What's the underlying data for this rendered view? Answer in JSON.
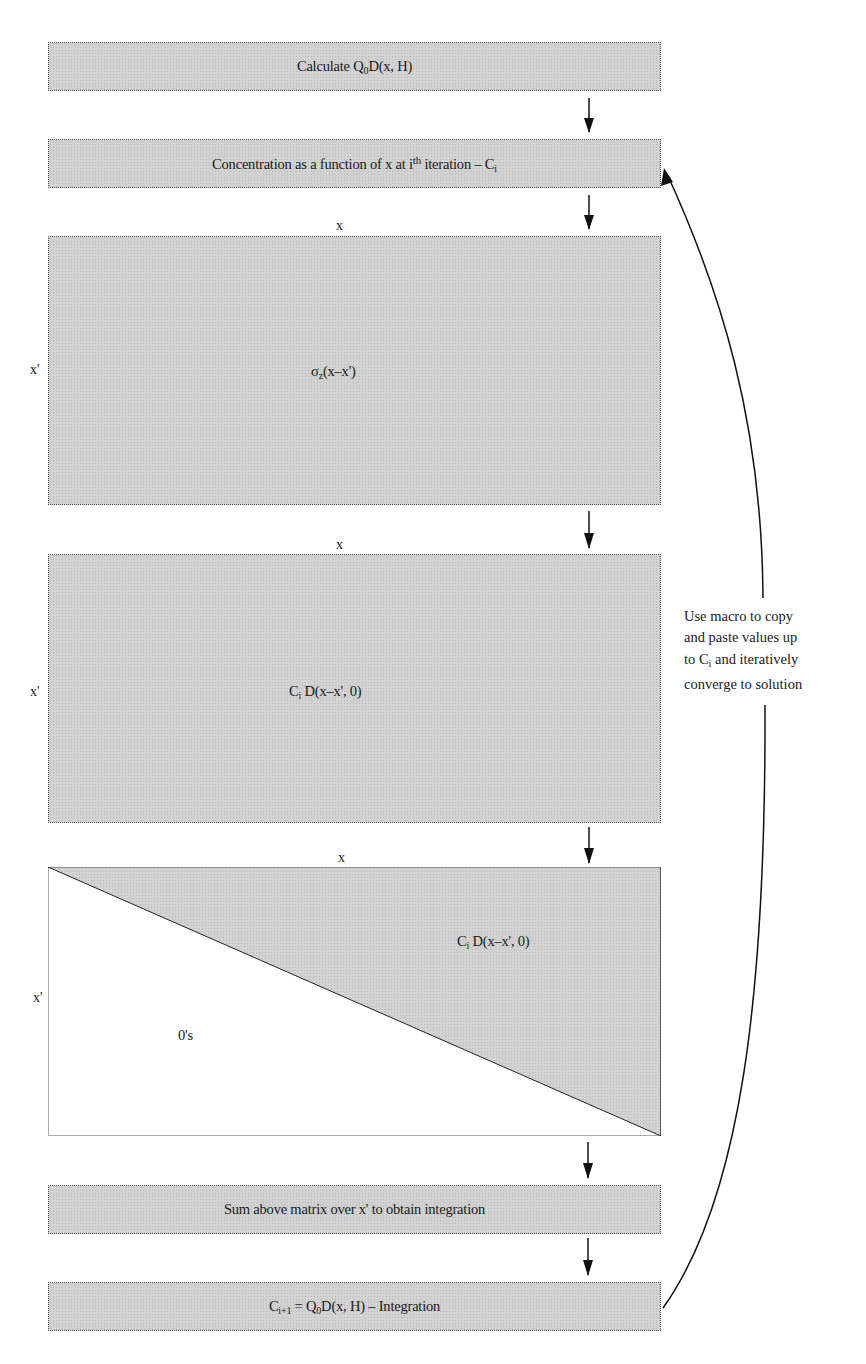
{
  "diagram": {
    "steps": [
      {
        "id": "calc",
        "pre": "Calculate Q",
        "sub": "0",
        "post": "D(x, H)"
      },
      {
        "id": "conc",
        "pre": "Concentration as a function of x at i",
        "sup": "th",
        "mid": " iteration – C",
        "sub": "i"
      },
      {
        "id": "sum",
        "text": "Sum above matrix over x' to obtain integration"
      },
      {
        "id": "next",
        "pre": "C",
        "sub": "i+1",
        "mid": " = Q",
        "sub2": "0",
        "post": "D(x, H) – Integration"
      }
    ],
    "matrices": [
      {
        "id": "sigma",
        "x_label": "x",
        "xp_label": "x'",
        "pre": "σ",
        "sub": "z",
        "post": "(x–x')"
      },
      {
        "id": "cid",
        "x_label": "x",
        "xp_label": "x'",
        "pre": "C",
        "sub": "i",
        "post": " D(x–x', 0)"
      },
      {
        "id": "upper",
        "x_label": "x",
        "xp_label": "x'",
        "pre": "C",
        "sub": "i",
        "post": " D(x–x', 0)",
        "zeros": "0's"
      }
    ],
    "loop_note": {
      "lines": [
        "Use macro to copy",
        "and paste values up",
        "to C",
        "and iteratively",
        "converge to solution"
      ],
      "sub": "i"
    },
    "colors": {
      "fill": "#d2d2d2",
      "stroke": "#1a1a1a",
      "background": "#ffffff"
    }
  }
}
